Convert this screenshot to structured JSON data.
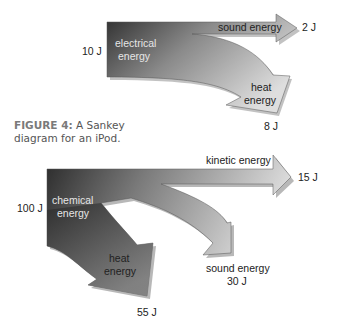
{
  "caption": {
    "figure_label": "FIGURE 4:",
    "text": " A Sankey diagram for an iPod."
  },
  "diagram_top": {
    "input": {
      "label_line1": "electrical",
      "label_line2": "energy",
      "value": "10 J"
    },
    "outputs": [
      {
        "label": "sound energy",
        "value": "2 J"
      },
      {
        "label_line1": "heat",
        "label_line2": "energy",
        "value": "8 J"
      }
    ]
  },
  "diagram_bottom": {
    "input": {
      "label_line1": "chemical",
      "label_line2": "energy",
      "value": "100 J"
    },
    "outputs": [
      {
        "label": "kinetic energy",
        "value": "15 J"
      },
      {
        "label_line1": "sound energy",
        "value": "30 J"
      },
      {
        "label_line1": "heat",
        "label_line2": "energy",
        "value": "55 J"
      }
    ]
  },
  "colors": {
    "dark": "#3a3a3a",
    "light": "#d8d8d8",
    "shadow": "#9a9a9a"
  }
}
